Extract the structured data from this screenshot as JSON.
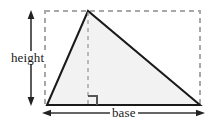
{
  "figure": {
    "background_color": "#ffffff"
  },
  "labels": {
    "height": "height",
    "base": "base"
  },
  "colors": {
    "triangle_fill": "#f2f2f2",
    "triangle_stroke": "#1a1a1a",
    "dashed_stroke": "#a8a8a8",
    "arrow_stroke": "#333333",
    "right_angle_stroke": "#555555",
    "text": "#1a1a1a"
  },
  "geometry": {
    "bounding_box": {
      "left": 45,
      "top": 11,
      "right": 200,
      "bottom": 105,
      "style": "dashed"
    },
    "triangle": {
      "vertex_bottom_left": [
        47,
        105
      ],
      "vertex_apex": [
        88,
        11
      ],
      "vertex_bottom_right": [
        200,
        105
      ],
      "fill": "#f2f2f2",
      "stroke_width": 2
    },
    "altitude": {
      "from": [
        88,
        11
      ],
      "to": [
        88,
        105
      ],
      "style": "dashed"
    },
    "right_angle_marker": {
      "at": [
        88,
        105
      ],
      "size": 9,
      "opens": "up-right"
    },
    "height_arrow": {
      "x": 31,
      "y_top": 11,
      "y_bottom": 105,
      "heads": "both"
    },
    "base_arrow": {
      "y": 113,
      "x_left": 43,
      "x_right": 204,
      "heads": "both"
    }
  }
}
